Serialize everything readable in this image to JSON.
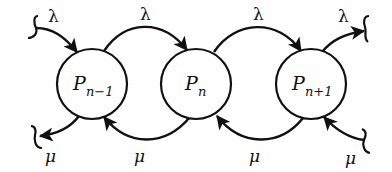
{
  "diagram": {
    "type": "birth-death-process",
    "nodes": [
      {
        "id": "p_n_minus_1",
        "base": "P",
        "subscript": "n−1",
        "cx": 92,
        "cy": 84,
        "r": 35
      },
      {
        "id": "p_n",
        "base": "P",
        "subscript": "n",
        "cx": 196,
        "cy": 84,
        "r": 35
      },
      {
        "id": "p_n_plus_1",
        "base": "P",
        "subscript": "n+1",
        "cx": 311,
        "cy": 84,
        "r": 35
      }
    ],
    "edges": [
      {
        "from": "incoming",
        "to": "p_n_minus_1",
        "label": "λ",
        "direction": "in"
      },
      {
        "from": "p_n_minus_1",
        "to": "p_n",
        "label": "λ"
      },
      {
        "from": "p_n",
        "to": "p_n_plus_1",
        "label": "λ"
      },
      {
        "from": "p_n_plus_1",
        "to": "outgoing",
        "label": "λ",
        "direction": "out"
      },
      {
        "from": "p_n_minus_1",
        "to": "outgoing",
        "label": "μ",
        "direction": "out"
      },
      {
        "from": "p_n",
        "to": "p_n_minus_1",
        "label": "μ"
      },
      {
        "from": "p_n_plus_1",
        "to": "p_n",
        "label": "μ"
      },
      {
        "from": "incoming",
        "to": "p_n_plus_1",
        "label": "μ",
        "direction": "in"
      }
    ],
    "labels": {
      "lambda": "λ",
      "mu": "μ",
      "node_base": "P",
      "sub_prev": "n−1",
      "sub_curr": "n",
      "sub_next": "n+1"
    },
    "colors": {
      "stroke": "#111111",
      "background": "#ffffff"
    }
  }
}
